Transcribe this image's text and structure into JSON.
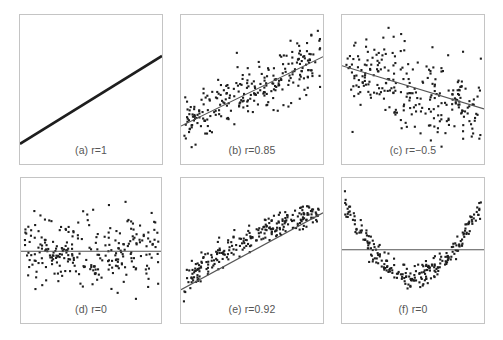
{
  "chart_data": [
    {
      "type": "scatter",
      "panel": "a",
      "title": "(a) r=1",
      "r": 1,
      "frame": {
        "x": 19,
        "y": 14,
        "w": 144,
        "h": 151
      },
      "fit_line": {
        "x1": 0,
        "y1": 0.865,
        "x2": 1,
        "y2": 0.275
      },
      "points_model": {
        "kind": "perfect_line",
        "n": 300,
        "seed": 11
      },
      "grid": false,
      "axes_ticks": false
    },
    {
      "type": "scatter",
      "panel": "b",
      "title": "(b) r=0.85",
      "r": 0.85,
      "frame": {
        "x": 180,
        "y": 14,
        "w": 144,
        "h": 151
      },
      "fit_line": {
        "x1": 0,
        "y1": 0.745,
        "x2": 1,
        "y2": 0.28
      },
      "points_model": {
        "kind": "linear_noise",
        "n": 260,
        "noise": 0.085,
        "seed": 23
      },
      "grid": false,
      "axes_ticks": false
    },
    {
      "type": "scatter",
      "panel": "c",
      "title": "(c) r=−0.5",
      "r": -0.5,
      "frame": {
        "x": 341,
        "y": 14,
        "w": 144,
        "h": 151
      },
      "fit_line": {
        "x1": 0,
        "y1": 0.34,
        "x2": 1,
        "y2": 0.63
      },
      "points_model": {
        "kind": "linear_noise",
        "n": 260,
        "noise": 0.14,
        "seed": 37
      },
      "grid": false,
      "axes_ticks": false
    },
    {
      "type": "scatter",
      "panel": "d",
      "title": "(d) r=0",
      "r": 0,
      "frame": {
        "x": 20,
        "y": 177,
        "w": 142,
        "h": 147
      },
      "fit_line": {
        "x1": 0,
        "y1": 0.505,
        "x2": 1,
        "y2": 0.505
      },
      "points_model": {
        "kind": "linear_noise",
        "n": 260,
        "noise": 0.12,
        "seed": 53
      },
      "grid": false,
      "axes_ticks": false
    },
    {
      "type": "scatter",
      "panel": "e",
      "title": "(e) r=0.92",
      "r": 0.92,
      "frame": {
        "x": 180,
        "y": 177,
        "w": 144,
        "h": 147
      },
      "fit_line": {
        "x1": 0,
        "y1": 0.77,
        "x2": 1,
        "y2": 0.24
      },
      "points_model": {
        "kind": "curved_concave",
        "n": 250,
        "noise": 0.045,
        "seed": 71
      },
      "grid": false,
      "axes_ticks": false
    },
    {
      "type": "scatter",
      "panel": "f",
      "title": "(f) r=0",
      "r": 0,
      "frame": {
        "x": 341,
        "y": 177,
        "w": 144,
        "h": 147
      },
      "fit_line": {
        "x1": 0,
        "y1": 0.495,
        "x2": 1,
        "y2": 0.495
      },
      "points_model": {
        "kind": "parabola",
        "n": 250,
        "noise": 0.04,
        "seed": 89
      },
      "grid": false,
      "axes_ticks": false
    }
  ],
  "panels": {
    "a": {
      "label": "(a) r=1"
    },
    "b": {
      "label": "(b) r=0.85"
    },
    "c": {
      "label": "(c) r=−0.5"
    },
    "d": {
      "label": "(d) r=0"
    },
    "e": {
      "label": "(e) r=0.92"
    },
    "f": {
      "label": "(f) r=0"
    }
  },
  "colors": {
    "point": "#1e1e1e",
    "line": "#555555",
    "border": "#c4c4c4",
    "label": "#555555",
    "background": "#ffffff"
  }
}
